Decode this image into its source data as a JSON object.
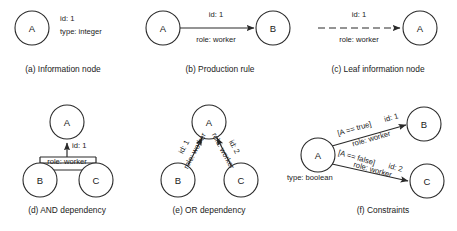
{
  "figure": {
    "background_color": "#ffffff",
    "stroke_color": "#2a2a2a",
    "panels": [
      {
        "key": "a",
        "caption": "(a) Information node",
        "caption_x": 63,
        "caption_y": 72,
        "nodes": [
          {
            "label": "A",
            "x": 32,
            "y": 28,
            "r": 17
          }
        ],
        "annotations": [
          {
            "text": "id: 1",
            "x": 60,
            "y": 21,
            "anchor": "start",
            "rotate": 0
          },
          {
            "text": "type: integer",
            "x": 60,
            "y": 34,
            "anchor": "start",
            "rotate": 0
          }
        ],
        "edges": []
      },
      {
        "key": "b",
        "caption": "(b) Production rule",
        "caption_x": 220,
        "caption_y": 72,
        "nodes": [
          {
            "label": "A",
            "x": 163,
            "y": 28,
            "r": 17
          },
          {
            "label": "B",
            "x": 273,
            "y": 28,
            "r": 17
          }
        ],
        "annotations": [
          {
            "text": "id: 1",
            "x": 216,
            "y": 17,
            "anchor": "middle",
            "rotate": 0
          },
          {
            "text": "role: worker",
            "x": 216,
            "y": 42,
            "anchor": "middle",
            "rotate": 0
          }
        ],
        "edges": [
          {
            "x1": 180,
            "y1": 28,
            "x2": 254,
            "y2": 28,
            "style": "solid",
            "arrow": true
          }
        ]
      },
      {
        "key": "c",
        "caption": "(c) Leaf information node",
        "caption_x": 378,
        "caption_y": 72,
        "nodes": [
          {
            "label": "A",
            "x": 420,
            "y": 28,
            "r": 17
          }
        ],
        "annotations": [
          {
            "text": "id: 1",
            "x": 359,
            "y": 17,
            "anchor": "middle",
            "rotate": 0
          },
          {
            "text": "role: worker",
            "x": 359,
            "y": 42,
            "anchor": "middle",
            "rotate": 0
          }
        ],
        "edges": [
          {
            "x1": 318,
            "y1": 28,
            "x2": 400,
            "y2": 28,
            "style": "dashed",
            "arrow": true
          }
        ]
      },
      {
        "key": "d",
        "caption": "(d) AND dependency",
        "caption_x": 67,
        "caption_y": 213,
        "nodes": [
          {
            "label": "A",
            "x": 67,
            "y": 122,
            "r": 17
          },
          {
            "label": "B",
            "x": 40,
            "y": 180,
            "r": 17
          },
          {
            "label": "C",
            "x": 96,
            "y": 180,
            "r": 17
          }
        ],
        "annotations": [
          {
            "text": "id: 1",
            "x": 72,
            "y": 148,
            "anchor": "start",
            "rotate": 0
          },
          {
            "text": "role: worker",
            "x": 67,
            "y": 164,
            "anchor": "middle",
            "rotate": 0
          }
        ],
        "edges": [
          {
            "x1": 67,
            "y1": 157,
            "x2": 67,
            "y2": 143,
            "style": "solid",
            "arrow": true
          },
          {
            "x1": 40,
            "y1": 163,
            "x2": 96,
            "y2": 163,
            "style": "solid",
            "arrow": false
          },
          {
            "x1": 40,
            "y1": 157,
            "x2": 40,
            "y2": 170,
            "style": "solid",
            "arrow": false
          },
          {
            "x1": 96,
            "y1": 157,
            "x2": 96,
            "y2": 170,
            "style": "solid",
            "arrow": false
          },
          {
            "x1": 40,
            "y1": 170,
            "x2": 96,
            "y2": 170,
            "style": "solid",
            "arrow": false
          },
          {
            "x1": 40,
            "y1": 157,
            "x2": 96,
            "y2": 157,
            "style": "solid",
            "arrow": false
          },
          {
            "x1": 40,
            "y1": 170,
            "x2": 40,
            "y2": 163,
            "style": "solid",
            "arrow": false
          }
        ]
      },
      {
        "key": "e",
        "caption": "(e) OR dependency",
        "caption_x": 209,
        "caption_y": 213,
        "nodes": [
          {
            "label": "A",
            "x": 209,
            "y": 122,
            "r": 17
          },
          {
            "label": "B",
            "x": 178,
            "y": 180,
            "r": 17
          },
          {
            "label": "C",
            "x": 241,
            "y": 180,
            "r": 17
          }
        ],
        "annotations": [
          {
            "text": "id: 1",
            "x": 186,
            "y": 148,
            "anchor": "middle",
            "rotate": -62
          },
          {
            "text": "role: worker",
            "x": 197,
            "y": 152,
            "anchor": "middle",
            "rotate": -62
          },
          {
            "text": "id: 2",
            "x": 232,
            "y": 148,
            "anchor": "middle",
            "rotate": 62
          },
          {
            "text": "role: worker",
            "x": 221,
            "y": 152,
            "anchor": "middle",
            "rotate": 62
          }
        ],
        "edges": [
          {
            "x1": 187,
            "y1": 167,
            "x2": 202,
            "y2": 138,
            "style": "solid",
            "arrow": true
          },
          {
            "x1": 232,
            "y1": 167,
            "x2": 217,
            "y2": 138,
            "style": "solid",
            "arrow": true
          }
        ]
      },
      {
        "key": "f",
        "caption": "(f) Constraints",
        "caption_x": 383,
        "caption_y": 213,
        "nodes": [
          {
            "label": "A",
            "x": 318,
            "y": 155,
            "r": 17
          },
          {
            "label": "B",
            "x": 424,
            "y": 124,
            "r": 17
          },
          {
            "label": "C",
            "x": 427,
            "y": 181,
            "r": 17
          }
        ],
        "annotations": [
          {
            "text": "type: boolean",
            "x": 287,
            "y": 180,
            "anchor": "start",
            "rotate": 0
          },
          {
            "text": "[A == true]",
            "x": 355,
            "y": 131,
            "anchor": "middle",
            "rotate": -16
          },
          {
            "text": "id: 1",
            "x": 392,
            "y": 120,
            "anchor": "middle",
            "rotate": -16
          },
          {
            "text": "role: worker",
            "x": 372,
            "y": 141,
            "anchor": "middle",
            "rotate": -16
          },
          {
            "text": "[A == false]",
            "x": 356,
            "y": 160,
            "anchor": "middle",
            "rotate": 16
          },
          {
            "text": "id: 2",
            "x": 395,
            "y": 170,
            "anchor": "middle",
            "rotate": 16
          },
          {
            "text": "role: worker",
            "x": 372,
            "y": 172,
            "anchor": "middle",
            "rotate": 16
          }
        ],
        "edges": [
          {
            "x1": 332,
            "y1": 146,
            "x2": 406,
            "y2": 125,
            "style": "solid",
            "arrow": true
          },
          {
            "x1": 332,
            "y1": 164,
            "x2": 408,
            "y2": 181,
            "style": "solid",
            "arrow": true
          }
        ]
      }
    ]
  }
}
